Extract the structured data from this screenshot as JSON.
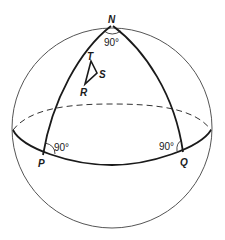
{
  "diagram": {
    "points": {
      "N": "N",
      "P": "P",
      "Q": "Q",
      "R": "R",
      "S": "S",
      "T": "T"
    },
    "angles": {
      "N": "90°",
      "P": "90°",
      "Q": "90°"
    },
    "colors": {
      "stroke": "#1a1a1a",
      "sphere_outline": "#555555",
      "background": "#ffffff"
    }
  }
}
